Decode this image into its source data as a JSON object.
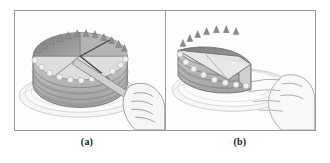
{
  "figure": {
    "kind": "two-panel grayscale line illustration",
    "background_color": "#ffffff",
    "frame_border_color": "#9a9a9a",
    "panel_fill_color": "#fdfdfd"
  },
  "panels": [
    {
      "id": "a",
      "caption": "(a)",
      "description": "Whole round layer cake on a ruffled plate, being cut with a knife held in a hand",
      "objects": {
        "cake": {
          "name": "round layer cake",
          "top_shading": "upper-left sector dark gray, lower half light gray",
          "sectors_drawn": 4,
          "side_layers": 3,
          "icing_border": "scalloped rosette edging on top rim and base",
          "spike_decoration": "pointed frosting peaks around top edge",
          "colors": {
            "top_dark": "#8d8d8d",
            "top_light": "#dcdcdc",
            "side_band_dark": "#9b9b9b",
            "side_band_light": "#e2e2e2",
            "outline": "#6b6b6b"
          }
        },
        "plate": {
          "name": "ruffled serving plate",
          "color": "#f2f2f2",
          "outline": "#b5b5b5"
        },
        "knife": {
          "name": "cake knife",
          "blade_color": "#c9c9c9",
          "handle_color": "#4a4a4a",
          "action": "slicing downward into the cake from the right"
        },
        "hand": {
          "name": "hand gripping knife",
          "fill": "#f4f4f4",
          "outline": "#8a8a8a",
          "position": "lower right of panel"
        }
      }
    },
    {
      "id": "b",
      "caption": "(b)",
      "description": "Remaining half of the cake on the plate with an open hand reaching toward it",
      "objects": {
        "cake": {
          "name": "partial cake with wedge removed",
          "top_shading": "upper-left wedge dark gray, cut face light gray",
          "side_layers": 3,
          "icing_border": "scalloped rosette edging along the curved rim",
          "colors": {
            "top_dark": "#8a8a8a",
            "top_light": "#dedede",
            "cut_face": "#ededed",
            "side_band_dark": "#9b9b9b",
            "side_band_light": "#e4e4e4",
            "outline": "#6b6b6b"
          }
        },
        "plate": {
          "name": "ruffled serving plate",
          "color": "#f4f4f4",
          "outline": "#bcbcbc"
        },
        "hand": {
          "name": "open hand reaching for slice",
          "fill": "#f6f6f6",
          "outline": "#9a9a9a",
          "position": "right side of panel, fingers extended left"
        }
      }
    }
  ]
}
